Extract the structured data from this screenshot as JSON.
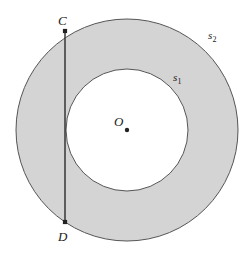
{
  "figure": {
    "background_color": "#ffffff",
    "annulus_fill": "#d4d4d4",
    "inner_fill": "#ffffff",
    "stroke_color": "#555555",
    "chord_color": "#2b2b2b",
    "marker_color": "#222222",
    "outer_circle": {
      "cx": 127,
      "cy": 130,
      "r": 111
    },
    "inner_circle": {
      "cx": 127,
      "cy": 130,
      "r": 61
    },
    "center_point": {
      "cx": 127,
      "cy": 130,
      "r": 2.2
    },
    "chord": {
      "x": 65,
      "y1": 31,
      "y2": 222
    },
    "markers": [
      {
        "x": 65,
        "y": 31,
        "size": 4.2
      },
      {
        "x": 65,
        "y": 222,
        "size": 4.2
      }
    ],
    "labels": {
      "point_c": "C",
      "point_d": "D",
      "center_o": "O",
      "inner_circle_name": "s",
      "inner_circle_sub": "1",
      "outer_circle_name": "s",
      "outer_circle_sub": "2"
    }
  }
}
